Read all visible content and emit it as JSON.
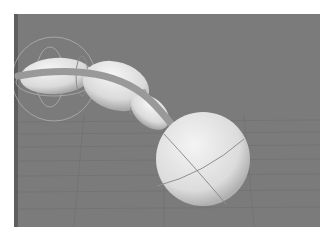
{
  "viewport": {
    "label": "3D viewport",
    "background": "#7b7b7b",
    "edge_color": "#5e5e5e",
    "grid_color": "#6d6d6d",
    "object_color": "#e6e6e6",
    "band_color": "#9a9a9a",
    "gizmo_color": "#b4b4b4"
  },
  "scene": {
    "objects": [
      {
        "name": "segment-1",
        "type": "ellipsoid"
      },
      {
        "name": "segment-2",
        "type": "ellipsoid"
      },
      {
        "name": "segment-3",
        "type": "ellipsoid"
      },
      {
        "name": "sphere",
        "type": "sphere"
      },
      {
        "name": "curve-band",
        "type": "curve"
      }
    ],
    "gizmos": [
      "rotate-gizmo-ring",
      "joint-ring-1",
      "joint-ring-2",
      "joint-ring-3"
    ]
  }
}
